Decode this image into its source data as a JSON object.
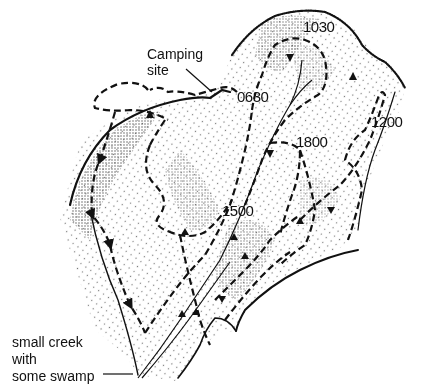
{
  "map": {
    "title": "",
    "annotations": {
      "camping_site": [
        "Camping",
        "site"
      ],
      "creek": [
        "small creek",
        "with",
        "some swamp"
      ]
    },
    "time_labels": [
      {
        "id": "t0630",
        "text": "0630",
        "x": 237,
        "y": 89
      },
      {
        "id": "t1030",
        "text": "1030",
        "x": 303,
        "y": 19
      },
      {
        "id": "t1200",
        "text": "1200",
        "x": 371,
        "y": 114
      },
      {
        "id": "t1800",
        "text": "1800",
        "x": 296,
        "y": 134
      },
      {
        "id": "t1500",
        "text": "1500",
        "x": 222,
        "y": 203
      }
    ],
    "legend": {
      "track": "dashed line with arrowheads = movement route",
      "creek": "solid line = creek",
      "stipple": "dotted shading = terrain / contours"
    },
    "colors": {
      "ink": "#111111",
      "background": "#ffffff",
      "stipple": "#555555"
    }
  }
}
